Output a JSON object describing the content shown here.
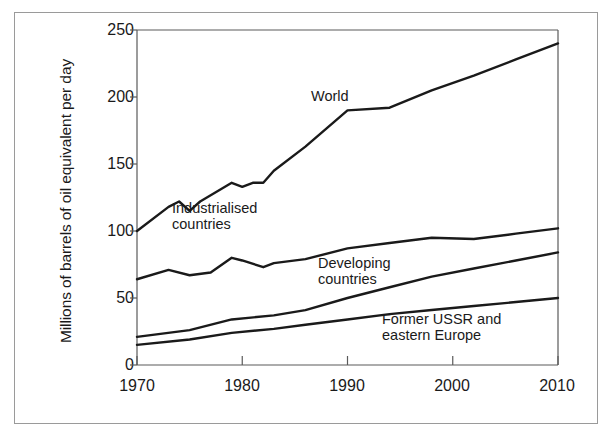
{
  "chart_data": {
    "type": "line",
    "title": "",
    "xlabel": "",
    "ylabel": "Millions of barrels of oil equivalent per day",
    "xlim": [
      1970,
      2010
    ],
    "ylim": [
      0,
      250
    ],
    "xticks": [
      1970,
      1980,
      1990,
      2000,
      2010
    ],
    "yticks": [
      0,
      50,
      100,
      150,
      200,
      250
    ],
    "grid": false,
    "legend_position": "inline-annotations",
    "line_color": "#1a1a1a",
    "series": [
      {
        "name": "World",
        "label": "World",
        "label_x": 1986.2,
        "label_y": 196,
        "x": [
          1970,
          1973,
          1974,
          1975,
          1976,
          1979,
          1980,
          1981,
          1982,
          1983,
          1986,
          1990,
          1994,
          1998,
          2002,
          2006,
          2010
        ],
        "values": [
          100,
          118,
          122,
          115,
          122,
          136,
          133,
          136,
          136,
          145,
          163,
          190,
          192,
          205,
          216,
          228,
          240
        ]
      },
      {
        "name": "Industrialised countries",
        "label": "Industrialised\ncountries",
        "label_x": 1974.2,
        "label_y": 112,
        "x": [
          1970,
          1973,
          1975,
          1977,
          1979,
          1980,
          1982,
          1983,
          1986,
          1990,
          1994,
          1998,
          2002,
          2006,
          2010
        ],
        "values": [
          64,
          71,
          67,
          69,
          80,
          78,
          73,
          76,
          79,
          87,
          91,
          95,
          94,
          98,
          102
        ]
      },
      {
        "name": "Developing countries",
        "label": "Developing\ncountries",
        "label_x": 1988.0,
        "label_y": 68,
        "x": [
          1970,
          1975,
          1979,
          1983,
          1986,
          1990,
          1994,
          1998,
          2002,
          2006,
          2010
        ],
        "values": [
          21,
          26,
          34,
          37,
          41,
          50,
          58,
          66,
          72,
          78,
          84
        ]
      },
      {
        "name": "Former USSR and eastern Europe",
        "label": "Former USSR and\neastern Europe",
        "label_x": 1993.0,
        "label_y": 26,
        "x": [
          1970,
          1975,
          1979,
          1983,
          1986,
          1990,
          1994,
          1998,
          2002,
          2006,
          2010
        ],
        "values": [
          15,
          19,
          24,
          27,
          30,
          34,
          38,
          41,
          44,
          47,
          50
        ]
      }
    ]
  },
  "axis": {
    "y_title": "Millions of barrels of oil equivalent per day",
    "y_tick_labels": [
      "250",
      "200",
      "150",
      "100",
      "50",
      "0"
    ],
    "x_tick_labels": [
      "1970",
      "1980",
      "1990",
      "2000",
      "2010"
    ]
  },
  "annotations": {
    "world": "World",
    "industrialised": "Industrialised\ncountries",
    "developing": "Developing\ncountries",
    "former_ussr": "Former USSR and\neastern Europe"
  }
}
